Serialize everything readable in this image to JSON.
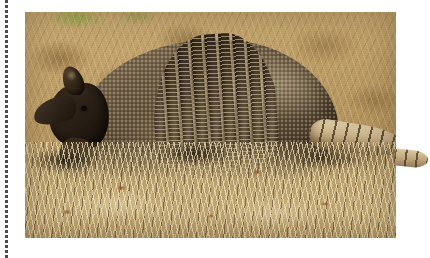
{
  "page": {
    "background_color": "#ffffff",
    "width": 430,
    "height": 258
  },
  "perforation": {
    "name": "dotted-tear-line",
    "orientation": "vertical",
    "position": "left-margin",
    "color": "#4a4a4a"
  },
  "photo": {
    "subject": "Nine-banded armadillo",
    "alt_text": "A nine-banded armadillo standing in profile on dry grass",
    "frame": {
      "x": 25,
      "y": 12,
      "width": 371,
      "height": 226
    },
    "colors": {
      "background_grass": "#c3a36c",
      "shell_dark": "#3a2f24",
      "shell_light": "#7b6a50",
      "tail_light": "#ddcba4",
      "shadow": "#1a1006",
      "green_patch": "#96a84a"
    },
    "elements": {
      "carapace": "armored-shell",
      "bands": "nine-movable-bands",
      "head": "head",
      "snout": "snout",
      "ear": "ear",
      "eye": "eye",
      "front_leg": "front-leg",
      "rear_leg": "rear-leg",
      "tail": "banded-tail",
      "foreground": "dry-straw-grass"
    },
    "band_count": 9
  }
}
